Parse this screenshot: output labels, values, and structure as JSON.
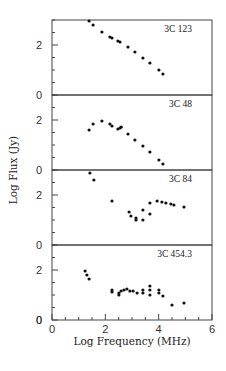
{
  "chart_data": {
    "type": "scatter",
    "layout": "stacked-panels",
    "xlabel": "Log Frequency (MHz)",
    "ylabel": "Log Flux (Jy)",
    "xlim": [
      0,
      6
    ],
    "ylim": [
      0,
      3
    ],
    "x_ticks": [
      0,
      2,
      4,
      6
    ],
    "x_minor_step": 0.5,
    "y_ticks": [
      0,
      2
    ],
    "y_minor_step": 0.5,
    "grid": false,
    "marker_color": "#111111",
    "panels": [
      {
        "name": "3C 123",
        "points": [
          [
            1.39,
            2.96
          ],
          [
            1.54,
            2.8
          ],
          [
            1.87,
            2.52
          ],
          [
            2.17,
            2.32
          ],
          [
            2.25,
            2.28
          ],
          [
            2.47,
            2.16
          ],
          [
            2.55,
            2.12
          ],
          [
            2.85,
            1.92
          ],
          [
            3.11,
            1.72
          ],
          [
            3.41,
            1.48
          ],
          [
            3.67,
            1.28
          ],
          [
            4.01,
            1.0
          ],
          [
            4.16,
            0.84
          ]
        ]
      },
      {
        "name": "3C 48",
        "points": [
          [
            1.39,
            1.6
          ],
          [
            1.54,
            1.84
          ],
          [
            1.87,
            1.96
          ],
          [
            2.17,
            1.84
          ],
          [
            2.25,
            1.76
          ],
          [
            2.47,
            1.64
          ],
          [
            2.55,
            1.68
          ],
          [
            2.6,
            1.72
          ],
          [
            2.85,
            1.44
          ],
          [
            3.11,
            1.2
          ],
          [
            3.41,
            0.96
          ],
          [
            3.67,
            0.72
          ],
          [
            4.01,
            0.4
          ],
          [
            4.16,
            0.24
          ]
        ]
      },
      {
        "name": "3C 84",
        "points": [
          [
            1.42,
            2.88
          ],
          [
            1.57,
            2.6
          ],
          [
            2.25,
            1.76
          ],
          [
            2.89,
            1.32
          ],
          [
            2.96,
            1.16
          ],
          [
            3.15,
            1.08
          ],
          [
            3.15,
            1.0
          ],
          [
            3.41,
            1.0
          ],
          [
            3.41,
            1.4
          ],
          [
            3.67,
            1.24
          ],
          [
            3.67,
            1.68
          ],
          [
            3.94,
            1.76
          ],
          [
            4.12,
            1.72
          ],
          [
            4.27,
            1.68
          ],
          [
            4.46,
            1.64
          ],
          [
            4.57,
            1.6
          ],
          [
            4.95,
            1.52
          ]
        ]
      },
      {
        "name": "3C 454.3",
        "points": [
          [
            1.24,
            1.96
          ],
          [
            1.31,
            1.8
          ],
          [
            1.39,
            1.64
          ],
          [
            2.25,
            1.2
          ],
          [
            2.25,
            1.12
          ],
          [
            2.51,
            1.08
          ],
          [
            2.51,
            1.0
          ],
          [
            2.59,
            1.16
          ],
          [
            2.7,
            1.2
          ],
          [
            2.81,
            1.24
          ],
          [
            2.92,
            1.16
          ],
          [
            3.04,
            1.16
          ],
          [
            3.19,
            1.08
          ],
          [
            3.41,
            1.08
          ],
          [
            3.41,
            1.2
          ],
          [
            3.67,
            1.36
          ],
          [
            3.67,
            1.2
          ],
          [
            3.67,
            1.0
          ],
          [
            4.01,
            1.2
          ],
          [
            4.01,
            1.08
          ],
          [
            4.16,
            0.96
          ],
          [
            4.5,
            0.6
          ],
          [
            4.95,
            0.68
          ]
        ]
      }
    ]
  },
  "labels": {
    "xlabel": "Log Frequency (MHz)",
    "ylabel": "Log Flux (Jy)"
  }
}
